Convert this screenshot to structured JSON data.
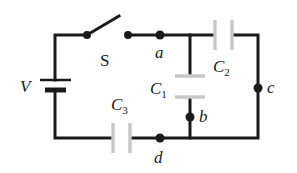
{
  "diagram": {
    "type": "circuit",
    "labels": {
      "battery": "V",
      "switch": "S",
      "node_a": "a",
      "node_b": "b",
      "node_c": "c",
      "node_d": "d",
      "c1_main": "C",
      "c1_sub": "1",
      "c2_main": "C",
      "c2_sub": "2",
      "c3_main": "C",
      "c3_sub": "3"
    },
    "components": [
      {
        "id": "V",
        "kind": "battery"
      },
      {
        "id": "S",
        "kind": "switch",
        "state": "open"
      },
      {
        "id": "C1",
        "kind": "capacitor",
        "between": [
          "a",
          "b"
        ]
      },
      {
        "id": "C2",
        "kind": "capacitor",
        "between": [
          "a",
          "c"
        ]
      },
      {
        "id": "C3",
        "kind": "capacitor",
        "between": [
          "V",
          "d"
        ]
      }
    ],
    "nodes": [
      "a",
      "b",
      "c",
      "d"
    ],
    "colors": {
      "wire": "#1a1a1a",
      "capacitor_plate": "#c8c8c8"
    }
  }
}
